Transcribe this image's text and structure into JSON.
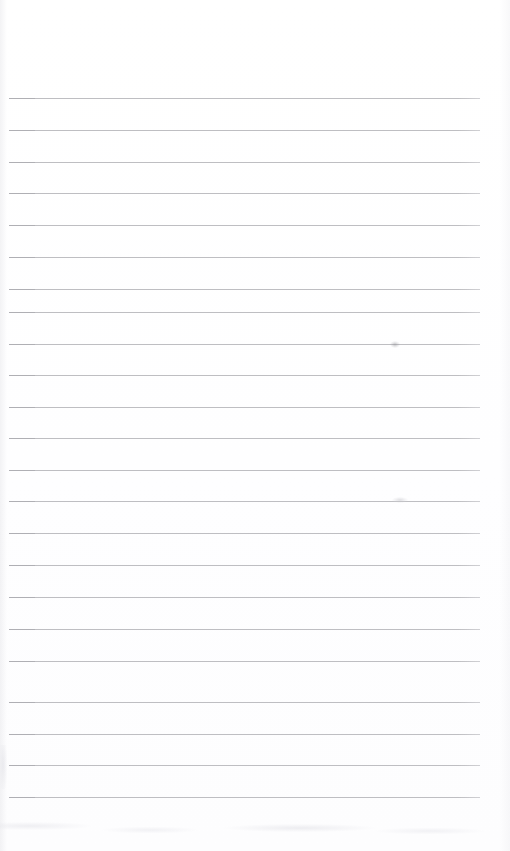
{
  "document": {
    "kind": "scanned-ruled-notepad-page",
    "page_width": 510,
    "page_height": 851,
    "background_color": "#ffffff",
    "orientation": "portrait",
    "content_text": "",
    "has_handwriting": false,
    "has_printed_text": false
  },
  "ruling": {
    "line_color": "#b9b9bd",
    "line_color_dense_start": "#a9a9ae",
    "line_thickness_px": 1,
    "line_count": 23,
    "first_line_y": 98,
    "line_spacing_px": 31.8,
    "left_margin_px": 9,
    "right_edge_px": 480,
    "line_length_px": 471,
    "lines": [
      {
        "index": 1,
        "y": 98,
        "x_start": 9,
        "x_end": 480
      },
      {
        "index": 2,
        "y": 130,
        "x_start": 9,
        "x_end": 480
      },
      {
        "index": 3,
        "y": 162,
        "x_start": 9,
        "x_end": 480
      },
      {
        "index": 4,
        "y": 193,
        "x_start": 9,
        "x_end": 480
      },
      {
        "index": 5,
        "y": 225,
        "x_start": 9,
        "x_end": 480
      },
      {
        "index": 6,
        "y": 257,
        "x_start": 9,
        "x_end": 480
      },
      {
        "index": 7,
        "y": 289,
        "x_start": 9,
        "x_end": 480
      },
      {
        "index": 8,
        "y": 312,
        "x_start": 9,
        "x_end": 480
      },
      {
        "index": 9,
        "y": 344,
        "x_start": 9,
        "x_end": 480
      },
      {
        "index": 10,
        "y": 375,
        "x_start": 9,
        "x_end": 480
      },
      {
        "index": 11,
        "y": 407,
        "x_start": 9,
        "x_end": 480
      },
      {
        "index": 12,
        "y": 438,
        "x_start": 9,
        "x_end": 480
      },
      {
        "index": 13,
        "y": 470,
        "x_start": 9,
        "x_end": 480
      },
      {
        "index": 14,
        "y": 501,
        "x_start": 9,
        "x_end": 480
      },
      {
        "index": 15,
        "y": 533,
        "x_start": 9,
        "x_end": 480
      },
      {
        "index": 16,
        "y": 565,
        "x_start": 9,
        "x_end": 480
      },
      {
        "index": 17,
        "y": 597,
        "x_start": 9,
        "x_end": 480
      },
      {
        "index": 18,
        "y": 629,
        "x_start": 9,
        "x_end": 480
      },
      {
        "index": 19,
        "y": 661,
        "x_start": 9,
        "x_end": 480
      },
      {
        "index": 20,
        "y": 702,
        "x_start": 9,
        "x_end": 480
      },
      {
        "index": 21,
        "y": 734,
        "x_start": 9,
        "x_end": 480
      },
      {
        "index": 22,
        "y": 765,
        "x_start": 9,
        "x_end": 480
      },
      {
        "index": 23,
        "y": 797,
        "x_start": 9,
        "x_end": 480
      }
    ]
  },
  "margins": {
    "top_blank_height_px": 98,
    "bottom_blank_height_px": 54
  },
  "artifacts": {
    "smudges": [
      {
        "name": "smudge-upper",
        "x": 390,
        "y": 341,
        "width": 10,
        "height": 7,
        "color": "#96969c"
      },
      {
        "name": "smudge-lower",
        "x": 392,
        "y": 497,
        "width": 16,
        "height": 6,
        "color": "#c6c6cc"
      }
    ],
    "bottom_noise": {
      "y": 812,
      "height": 34
    },
    "left_noise": {
      "x": 0,
      "y": 745,
      "width": 8,
      "height": 44
    }
  }
}
